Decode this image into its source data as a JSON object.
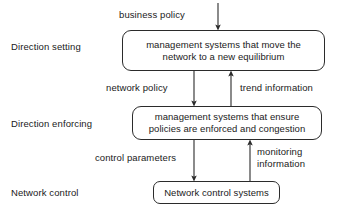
{
  "diagram": {
    "background_color": "#ffffff",
    "line_color": "#2b2b2b",
    "text_color": "#1a1a1a",
    "layers": [
      {
        "id": "direction-setting",
        "label": "Direction setting"
      },
      {
        "id": "direction-enforcing",
        "label": "Direction enforcing"
      },
      {
        "id": "network-control",
        "label": "Network control"
      }
    ],
    "nodes": [
      {
        "id": "management-systems-equilibrium",
        "text": "management systems that move the network to a new equilibrium",
        "layer": "direction-setting"
      },
      {
        "id": "management-systems-enforcement",
        "text": "management systems that ensure policies are enforced and congestion",
        "layer": "direction-enforcing"
      },
      {
        "id": "network-control-systems",
        "text": "Network control systems",
        "layer": "network-control"
      }
    ],
    "edges": [
      {
        "id": "business-policy",
        "label": "business policy",
        "from": "external-input",
        "to": "management-systems-equilibrium",
        "direction": "down"
      },
      {
        "id": "network-policy",
        "label": "network policy",
        "from": "management-systems-equilibrium",
        "to": "management-systems-enforcement",
        "direction": "down"
      },
      {
        "id": "trend-information",
        "label": "trend information",
        "from": "management-systems-enforcement",
        "to": "management-systems-equilibrium",
        "direction": "up"
      },
      {
        "id": "control-parameters",
        "label": "control parameters",
        "from": "management-systems-enforcement",
        "to": "network-control-systems",
        "direction": "down"
      },
      {
        "id": "monitoring-information",
        "label": "monitoring information",
        "label_line1": "monitoring",
        "label_line2": "information",
        "from": "network-control-systems",
        "to": "management-systems-enforcement",
        "direction": "up"
      }
    ]
  }
}
